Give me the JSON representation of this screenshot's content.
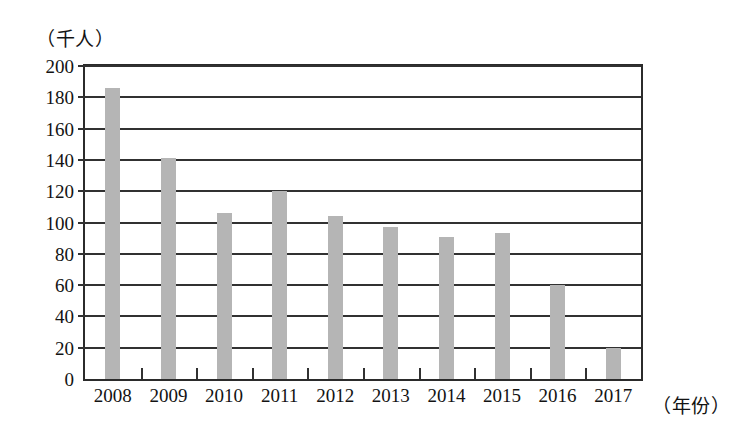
{
  "chart_data": {
    "type": "bar",
    "title": "",
    "subtitle": "",
    "xlabel": "（年份）",
    "ylabel": "（千人）",
    "categories": [
      "2008",
      "2009",
      "2010",
      "2011",
      "2012",
      "2013",
      "2014",
      "2015",
      "2016",
      "2017"
    ],
    "values": [
      186,
      141,
      106,
      120,
      104,
      97,
      91,
      93,
      60,
      20
    ],
    "ylim": [
      0,
      200
    ],
    "ytick_labels": [
      "200",
      "180",
      "160",
      "140",
      "120",
      "100",
      "80",
      "60",
      "40",
      "20",
      "0"
    ],
    "ytick_values": [
      200,
      180,
      160,
      140,
      120,
      100,
      80,
      60,
      40,
      20,
      0
    ],
    "ytick_step": 20,
    "grid": "horizontal",
    "legend": "none",
    "bar_color": "#b5b5b5",
    "axis_color": "#313131",
    "background_color": "#ffffff",
    "annotations": []
  }
}
